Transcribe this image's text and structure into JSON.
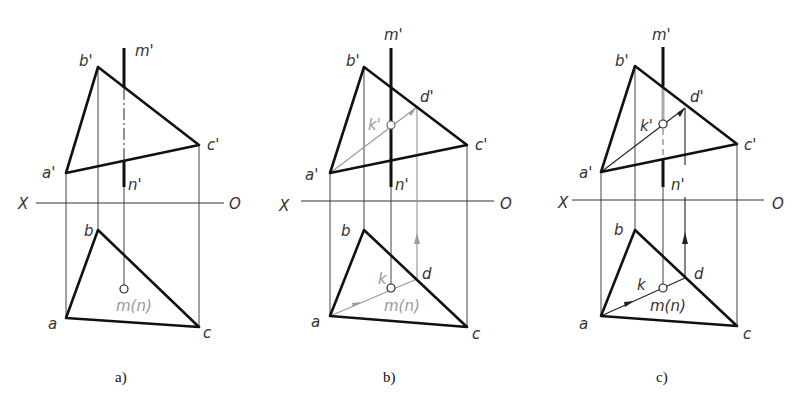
{
  "figure": {
    "axis_labels": {
      "left": "X",
      "right": "O"
    },
    "panels": [
      {
        "caption": "a)",
        "labels": {
          "b_prime": "b'",
          "a_prime": "a'",
          "c_prime": "c'",
          "m_prime": "m'",
          "n_prime": "n'",
          "b": "b",
          "a": "a",
          "c": "c",
          "mn": "m(n)"
        }
      },
      {
        "caption": "b)",
        "labels": {
          "b_prime": "b'",
          "a_prime": "a'",
          "c_prime": "c'",
          "m_prime": "m'",
          "n_prime": "n'",
          "d_prime": "d'",
          "k_prime": "k'",
          "b": "b",
          "a": "a",
          "c": "c",
          "d": "d",
          "k": "k",
          "mn": "m(n)"
        }
      },
      {
        "caption": "c)",
        "labels": {
          "b_prime": "b'",
          "a_prime": "a'",
          "c_prime": "c'",
          "m_prime": "m'",
          "n_prime": "n'",
          "d_prime": "d'",
          "k_prime": "k'",
          "b": "b",
          "a": "a",
          "c": "c",
          "d": "d",
          "k": "k",
          "mn": "m(n)"
        }
      }
    ]
  },
  "colors": {
    "line": "#222222",
    "thin": "#444444",
    "aux": "#9a9a9a"
  }
}
